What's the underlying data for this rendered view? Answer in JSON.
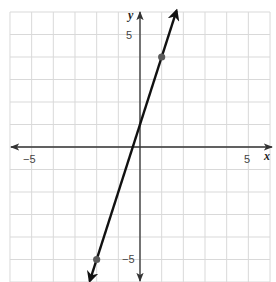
{
  "chart_data": {
    "type": "line",
    "title": "",
    "xlabel": "x",
    "ylabel": "y",
    "xlim": [
      -6,
      6
    ],
    "ylim": [
      -6,
      6
    ],
    "grid": true,
    "grid_step": 1,
    "x_tick_labels": [
      {
        "value": -5,
        "label": "−5"
      },
      {
        "value": 5,
        "label": "5"
      }
    ],
    "y_tick_labels": [
      {
        "value": 5,
        "label": "5"
      },
      {
        "value": -5,
        "label": "−5"
      }
    ],
    "series": [
      {
        "name": "line",
        "equation": "y = 3x + 1",
        "slope": 3,
        "intercept": 1,
        "arrows": "both",
        "points": [
          {
            "x": 1,
            "y": 4
          },
          {
            "x": -2,
            "y": -5
          }
        ]
      }
    ],
    "colors": {
      "line": "#111111",
      "points": "#5a5a5a",
      "grid": "#d9d9d9",
      "axes": "#333333"
    }
  },
  "labels": {
    "x_axis": "x",
    "y_axis": "y",
    "x_pos_tick": "5",
    "x_neg_tick": "−5",
    "y_pos_tick": "5",
    "y_neg_tick": "−5"
  }
}
